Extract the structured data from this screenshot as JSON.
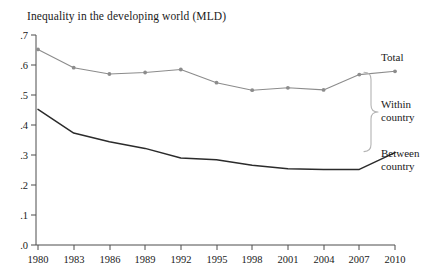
{
  "chart_data": {
    "type": "line",
    "title": "Inequality in the developing world (MLD)",
    "xlabel": "",
    "ylabel": "",
    "xlim": [
      1980,
      2010
    ],
    "ylim": [
      0,
      0.7
    ],
    "grid": false,
    "legend_position": "right-annotations",
    "x_ticks": [
      "1980",
      "1983",
      "1986",
      "1989",
      "1992",
      "1995",
      "1998",
      "2001",
      "2004",
      "2007",
      "2010"
    ],
    "y_ticks": [
      ".0",
      ".1",
      ".2",
      ".3",
      ".4",
      ".5",
      ".6",
      ".7"
    ],
    "x": [
      1980,
      1983,
      1986,
      1989,
      1992,
      1995,
      1998,
      2001,
      2004,
      2007,
      2010
    ],
    "series": [
      {
        "name": "Total",
        "color": "#8c8c8c",
        "marker": "circle",
        "values": [
          0.652,
          0.591,
          0.57,
          0.575,
          0.585,
          0.541,
          0.516,
          0.524,
          0.517,
          0.568,
          0.579
        ]
      },
      {
        "name": "Between country",
        "color": "#2b2b2b",
        "marker": "none",
        "values": [
          0.452,
          0.373,
          0.344,
          0.322,
          0.29,
          0.284,
          0.266,
          0.254,
          0.252,
          0.252,
          0.308
        ]
      }
    ],
    "annotations": [
      {
        "id": "total",
        "text": "Total"
      },
      {
        "id": "within",
        "line1": "Within",
        "line2": "country"
      },
      {
        "id": "between",
        "line1": "Between",
        "line2": "country"
      }
    ],
    "brace": {
      "description": "right curly brace spanning between Total line and Between country line at 2010",
      "label": "Within country"
    },
    "colors": {
      "axis": "#4d4d4d",
      "total_line": "#8c8c8c",
      "between_line": "#2b2b2b",
      "background": "#ffffff",
      "text": "#1a1a1a"
    }
  }
}
